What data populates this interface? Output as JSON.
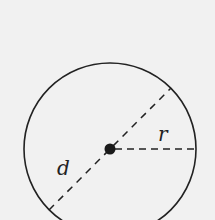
{
  "diagram": {
    "type": "circle-geometry",
    "labels": {
      "diameter": "d",
      "radius": "r"
    },
    "colors": {
      "background": "#f1f1f1",
      "stroke": "#222222"
    }
  }
}
